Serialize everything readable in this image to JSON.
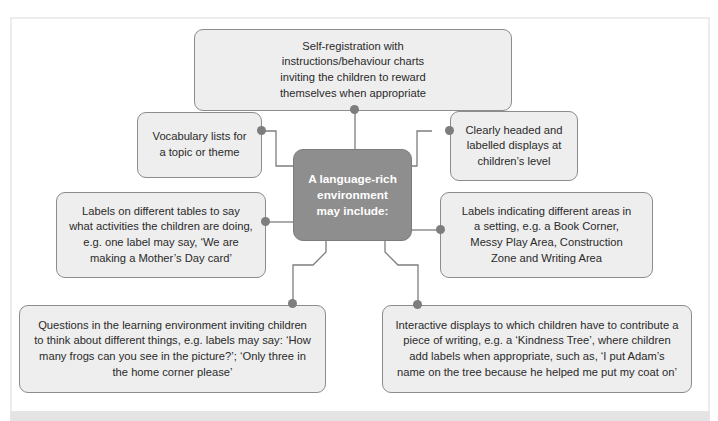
{
  "diagram": {
    "type": "mind-map",
    "center": {
      "text": "A language-rich environment may include:"
    },
    "nodes": [
      {
        "id": "self-registration",
        "text": "Self-registration with instructions/behaviour charts inviting the children to reward themselves when appropriate"
      },
      {
        "id": "vocabulary-lists",
        "text": "Vocabulary lists for a topic or theme"
      },
      {
        "id": "clearly-headed-displays",
        "text": "Clearly headed and labelled displays at children’s level"
      },
      {
        "id": "table-labels",
        "text": "Labels on different tables to say what activities the children are doing, e.g. one label may say, ‘We are making a Mother’s Day card’"
      },
      {
        "id": "area-labels",
        "text": "Labels indicating different areas in a setting, e.g. a Book Corner, Messy Play Area, Construction Zone and Writing Area"
      },
      {
        "id": "questions",
        "text": "Questions in the learning environment inviting children to think about different things, e.g. labels may say: ‘How many frogs can you see in the picture?’;  ‘Only three in the home corner please’"
      },
      {
        "id": "interactive-displays",
        "text": "Interactive displays to which children have to contribute a piece of writing, e.g. a ‘Kindness Tree’, where children add labels when appropriate, such as, ‘I put Adam’s name on the tree because he helped me put my coat on’"
      }
    ],
    "colors": {
      "node_fill": "#eeeeee",
      "node_border": "#8c8c8c",
      "center_fill": "#8e8e8e",
      "center_text": "#ffffff",
      "connector": "#7d7d7d"
    }
  }
}
